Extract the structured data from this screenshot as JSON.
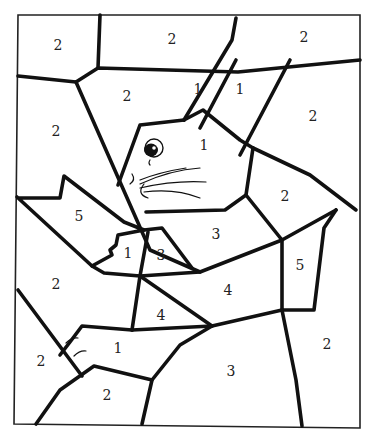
{
  "regions": [
    {
      "id": "r1",
      "label": "2",
      "x": 58,
      "y": 46
    },
    {
      "id": "r2",
      "label": "2",
      "x": 172,
      "y": 40
    },
    {
      "id": "r3",
      "label": "2",
      "x": 304,
      "y": 38
    },
    {
      "id": "r4",
      "label": "2",
      "x": 127,
      "y": 97
    },
    {
      "id": "r5",
      "label": "1",
      "x": 198,
      "y": 90
    },
    {
      "id": "r6",
      "label": "1",
      "x": 240,
      "y": 90
    },
    {
      "id": "r7",
      "label": "2",
      "x": 313,
      "y": 117
    },
    {
      "id": "r8",
      "label": "2",
      "x": 56,
      "y": 132
    },
    {
      "id": "r9",
      "label": "1",
      "x": 204,
      "y": 146
    },
    {
      "id": "r10",
      "label": "2",
      "x": 285,
      "y": 197
    },
    {
      "id": "r11",
      "label": "5",
      "x": 79,
      "y": 217
    },
    {
      "id": "r12",
      "label": "3",
      "x": 216,
      "y": 235
    },
    {
      "id": "r13",
      "label": "1",
      "x": 128,
      "y": 254
    },
    {
      "id": "r14",
      "label": "3",
      "x": 161,
      "y": 256
    },
    {
      "id": "r15",
      "label": "5",
      "x": 300,
      "y": 266
    },
    {
      "id": "r16",
      "label": "2",
      "x": 56,
      "y": 285
    },
    {
      "id": "r17",
      "label": "4",
      "x": 228,
      "y": 291
    },
    {
      "id": "r18",
      "label": "4",
      "x": 161,
      "y": 316
    },
    {
      "id": "r19",
      "label": "2",
      "x": 327,
      "y": 345
    },
    {
      "id": "r20",
      "label": "1",
      "x": 118,
      "y": 349
    },
    {
      "id": "r21",
      "label": "2",
      "x": 41,
      "y": 362
    },
    {
      "id": "r22",
      "label": "3",
      "x": 231,
      "y": 372
    },
    {
      "id": "r23",
      "label": "2",
      "x": 107,
      "y": 396
    }
  ]
}
